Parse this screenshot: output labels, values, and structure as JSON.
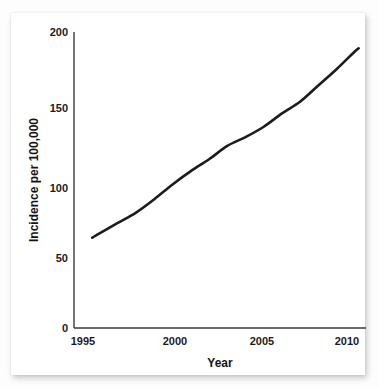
{
  "chart_data": {
    "type": "line",
    "title": "",
    "subtitle": "",
    "xlabel": "Year",
    "ylabel": "Incidence per 100,000",
    "xlim": [
      1994.6,
      2010.6
    ],
    "ylim": [
      0,
      200
    ],
    "xticks": [
      1995,
      2000,
      2005,
      2010
    ],
    "xtick_labels": [
      "1995",
      "2000",
      "2005",
      "2010"
    ],
    "yticks": [
      0,
      50,
      100,
      150,
      200
    ],
    "ytick_labels": [
      "0",
      "50",
      "100",
      "150",
      "200"
    ],
    "grid": false,
    "legend": null,
    "legend_position": "none",
    "line_color": "#1c1c1c",
    "series": [
      {
        "name": "Incidence",
        "x": [
          1995.6,
          1996,
          1997,
          1998,
          1999,
          2000,
          2001,
          2002,
          2003,
          2004,
          2005,
          2006,
          2007,
          2008,
          2009,
          2010,
          2010.2
        ],
        "values": [
          61,
          64,
          71,
          78,
          87,
          97,
          106,
          114,
          123,
          129,
          136,
          145,
          153,
          164,
          175,
          187,
          189
        ]
      }
    ],
    "annotations": []
  },
  "axes": {
    "y_title": "Incidence per 100,000",
    "x_title": "Year",
    "y_tick_0": "0",
    "y_tick_50": "50",
    "y_tick_100": "100",
    "y_tick_150": "150",
    "y_tick_200": "200",
    "x_tick_1995": "1995",
    "x_tick_2000": "2000",
    "x_tick_2005": "2005",
    "x_tick_2010": "2010"
  },
  "colors": {
    "line": "#1c1c1c",
    "axis": "#3a3a3a",
    "text": "#1b1b1b",
    "card_background": "#ffffff",
    "page_background": "#fdfdfd"
  }
}
